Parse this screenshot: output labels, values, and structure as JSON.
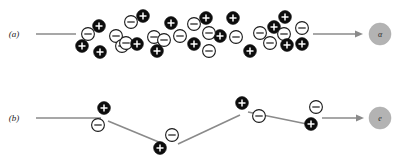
{
  "figure": {
    "width": 403,
    "height": 162,
    "background_color": "#ffffff"
  },
  "colors": {
    "positive_ion_fill": "#0d0d0d",
    "positive_ion_sign": "#ffffff",
    "negative_ion_fill": "#ffffff",
    "negative_ion_stroke": "#1a1a1a",
    "track_line": "#8a8a8a",
    "target_disc": "#b3b3b3",
    "label_text": "#1a1a1a"
  },
  "panels": [
    {
      "id": "panel-a",
      "label": "(a)",
      "label_x": 14,
      "label_y": 37,
      "entry_line": {
        "x1": 36,
        "y1": 34,
        "x2": 76,
        "y2": 34
      },
      "exit_arrow": {
        "x1": 310,
        "y1": 34,
        "x2": 361,
        "y2": 34
      },
      "target": {
        "name": "alpha-particle",
        "glyph": "α",
        "cx": 380,
        "cy": 34,
        "r": 11
      },
      "ions": [
        {
          "charge": "-",
          "cx": 88,
          "cy": 34
        },
        {
          "charge": "+",
          "cx": 99,
          "cy": 26
        },
        {
          "charge": "+",
          "cx": 82,
          "cy": 46
        },
        {
          "charge": "+",
          "cx": 100,
          "cy": 52
        },
        {
          "charge": "-",
          "cx": 116,
          "cy": 36
        },
        {
          "charge": "-",
          "cx": 122,
          "cy": 46
        },
        {
          "charge": "-",
          "cx": 131,
          "cy": 22
        },
        {
          "charge": "+",
          "cx": 143,
          "cy": 16
        },
        {
          "charge": "-",
          "cx": 126,
          "cy": 43
        },
        {
          "charge": "+",
          "cx": 135,
          "cy": 43
        },
        {
          "charge": "-",
          "cx": 154,
          "cy": 37
        },
        {
          "charge": "-",
          "cx": 164,
          "cy": 40
        },
        {
          "charge": "+",
          "cx": 171,
          "cy": 23
        },
        {
          "charge": "-",
          "cx": 180,
          "cy": 36
        },
        {
          "charge": "-",
          "cx": 194,
          "cy": 24
        },
        {
          "charge": "+",
          "cx": 194,
          "cy": 44
        },
        {
          "charge": "+",
          "cx": 157,
          "cy": 51
        },
        {
          "charge": "-",
          "cx": 209,
          "cy": 33
        },
        {
          "charge": "+",
          "cx": 206,
          "cy": 18
        },
        {
          "charge": "+",
          "cx": 220,
          "cy": 36
        },
        {
          "charge": "-",
          "cx": 221,
          "cy": 32
        },
        {
          "charge": "-",
          "cx": 209,
          "cy": 51
        },
        {
          "charge": "+",
          "cx": 233,
          "cy": 18
        },
        {
          "charge": "-",
          "cx": 236,
          "cy": 37
        },
        {
          "charge": "+",
          "cx": 250,
          "cy": 51
        },
        {
          "charge": "-",
          "cx": 260,
          "cy": 33
        },
        {
          "charge": "-",
          "cx": 270,
          "cy": 43
        },
        {
          "charge": "+",
          "cx": 272,
          "cy": 26
        },
        {
          "charge": "+",
          "cx": 284,
          "cy": 18
        },
        {
          "charge": "-",
          "cx": 283,
          "cy": 34
        },
        {
          "charge": "+",
          "cx": 286,
          "cy": 45
        },
        {
          "charge": "-",
          "cx": 302,
          "cy": 28
        },
        {
          "charge": "+",
          "cx": 302,
          "cy": 44
        }
      ]
    },
    {
      "id": "panel-b",
      "label": "(b)",
      "label_x": 14,
      "label_y": 118,
      "target": {
        "name": "electron",
        "glyph": "e",
        "cx": 380,
        "cy": 118,
        "r": 11
      },
      "track_points": [
        {
          "x": 36,
          "y": 118
        },
        {
          "x": 101,
          "y": 118
        },
        {
          "x": 160,
          "y": 143
        },
        {
          "x": 176,
          "y": 143
        },
        {
          "x": 243,
          "y": 112
        },
        {
          "x": 262,
          "y": 112
        },
        {
          "x": 318,
          "y": 123
        }
      ],
      "exit_arrow": {
        "x1": 330,
        "y1": 118,
        "x2": 362,
        "y2": 118
      },
      "ions": [
        {
          "charge": "+",
          "cx": 104,
          "cy": 108
        },
        {
          "charge": "-",
          "cx": 98,
          "cy": 125
        },
        {
          "charge": "-",
          "cx": 170,
          "cy": 134
        },
        {
          "charge": "+",
          "cx": 159,
          "cy": 147
        },
        {
          "charge": "+",
          "cx": 240,
          "cy": 104
        },
        {
          "charge": "-",
          "cx": 258,
          "cy": 116
        },
        {
          "charge": "-",
          "cx": 315,
          "cy": 107
        },
        {
          "charge": "+",
          "cx": 310,
          "cy": 124
        }
      ]
    }
  ]
}
